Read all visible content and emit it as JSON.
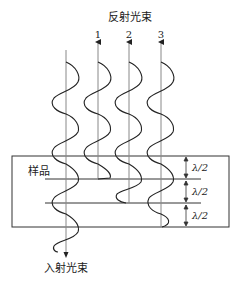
{
  "labels": {
    "reflected": "反射光束",
    "incident": "入射光束",
    "sample": "样品",
    "beam1": "1",
    "beam2": "2",
    "beam3": "3",
    "half_lambda": "λ/2"
  },
  "colors": {
    "line": "#333333",
    "wave": "#222222",
    "ref_line": "#888888"
  }
}
